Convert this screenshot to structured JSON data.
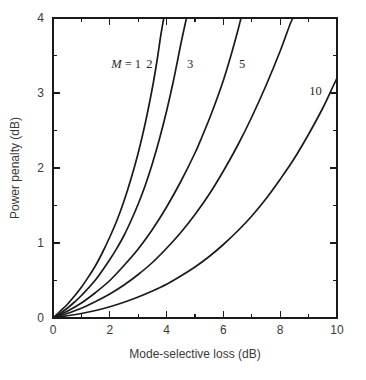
{
  "chart_data": {
    "type": "line",
    "title": "",
    "xlabel": "Mode-selective loss (dB)",
    "ylabel": "Power penalty (dB)",
    "xlim": [
      0,
      10
    ],
    "ylim": [
      0,
      4
    ],
    "grid": false,
    "legend_position": "inline-curve-labels",
    "x_ticks_major": [
      0,
      2,
      4,
      6,
      8,
      10
    ],
    "x_ticks_minor": [
      1,
      3,
      5,
      7,
      9
    ],
    "x_tick_labels": [
      "0",
      "2",
      "4",
      "6",
      "8",
      "10"
    ],
    "y_ticks_major": [
      0,
      1,
      2,
      3,
      4
    ],
    "y_ticks_minor": [
      0.5,
      1.5,
      2.5,
      3.5
    ],
    "y_tick_labels": [
      "0",
      "1",
      "2",
      "3",
      "4"
    ],
    "series": [
      {
        "name": "M = 1",
        "label": "M = 1",
        "label_x": 2.05,
        "label_y": 3.33,
        "points": [
          [
            0,
            0
          ],
          [
            0.25,
            0.09
          ],
          [
            0.5,
            0.18
          ],
          [
            0.75,
            0.29
          ],
          [
            1.0,
            0.41
          ],
          [
            1.25,
            0.55
          ],
          [
            1.5,
            0.7
          ],
          [
            1.75,
            0.88
          ],
          [
            2.0,
            1.08
          ],
          [
            2.25,
            1.3
          ],
          [
            2.5,
            1.56
          ],
          [
            2.75,
            1.86
          ],
          [
            3.0,
            2.2
          ],
          [
            3.25,
            2.6
          ],
          [
            3.5,
            3.07
          ],
          [
            3.65,
            3.4
          ],
          [
            3.8,
            3.78
          ],
          [
            3.9,
            4.0
          ]
        ]
      },
      {
        "name": "M = 2",
        "label": "2",
        "label_x": 3.28,
        "label_y": 3.33,
        "points": [
          [
            0,
            0
          ],
          [
            0.25,
            0.06
          ],
          [
            0.5,
            0.13
          ],
          [
            0.75,
            0.21
          ],
          [
            1.0,
            0.3
          ],
          [
            1.5,
            0.51
          ],
          [
            2.0,
            0.78
          ],
          [
            2.25,
            0.93
          ],
          [
            2.5,
            1.1
          ],
          [
            2.75,
            1.3
          ],
          [
            3.0,
            1.52
          ],
          [
            3.25,
            1.77
          ],
          [
            3.5,
            2.06
          ],
          [
            3.75,
            2.39
          ],
          [
            4.0,
            2.76
          ],
          [
            4.25,
            3.18
          ],
          [
            4.5,
            3.65
          ],
          [
            4.7,
            4.0
          ]
        ]
      },
      {
        "name": "M = 3",
        "label": "3",
        "label_x": 4.72,
        "label_y": 3.33,
        "points": [
          [
            0,
            0
          ],
          [
            0.5,
            0.09
          ],
          [
            1.0,
            0.2
          ],
          [
            1.5,
            0.34
          ],
          [
            2.0,
            0.5
          ],
          [
            2.5,
            0.7
          ],
          [
            3.0,
            0.92
          ],
          [
            3.5,
            1.18
          ],
          [
            4.0,
            1.48
          ],
          [
            4.5,
            1.82
          ],
          [
            5.0,
            2.2
          ],
          [
            5.25,
            2.42
          ],
          [
            5.5,
            2.65
          ],
          [
            5.75,
            2.9
          ],
          [
            6.0,
            3.17
          ],
          [
            6.25,
            3.48
          ],
          [
            6.5,
            3.82
          ],
          [
            6.62,
            4.0
          ]
        ]
      },
      {
        "name": "M = 5",
        "label": "5",
        "label_x": 6.55,
        "label_y": 3.33,
        "points": [
          [
            0,
            0
          ],
          [
            0.5,
            0.06
          ],
          [
            1.0,
            0.13
          ],
          [
            1.5,
            0.22
          ],
          [
            2.0,
            0.32
          ],
          [
            2.5,
            0.44
          ],
          [
            3.0,
            0.58
          ],
          [
            3.5,
            0.74
          ],
          [
            4.0,
            0.93
          ],
          [
            4.5,
            1.14
          ],
          [
            5.0,
            1.38
          ],
          [
            5.5,
            1.65
          ],
          [
            6.0,
            1.96
          ],
          [
            6.5,
            2.3
          ],
          [
            7.0,
            2.68
          ],
          [
            7.5,
            3.1
          ],
          [
            8.0,
            3.56
          ],
          [
            8.35,
            3.92
          ],
          [
            8.45,
            4.0
          ]
        ]
      },
      {
        "name": "M = 10",
        "label": "10",
        "label_x": 9.02,
        "label_y": 2.98,
        "points": [
          [
            0,
            0
          ],
          [
            0.5,
            0.03
          ],
          [
            1.0,
            0.06
          ],
          [
            1.5,
            0.1
          ],
          [
            2.0,
            0.15
          ],
          [
            2.5,
            0.21
          ],
          [
            3.0,
            0.28
          ],
          [
            3.5,
            0.36
          ],
          [
            4.0,
            0.45
          ],
          [
            4.5,
            0.56
          ],
          [
            5.0,
            0.68
          ],
          [
            5.5,
            0.82
          ],
          [
            6.0,
            0.98
          ],
          [
            6.5,
            1.16
          ],
          [
            7.0,
            1.36
          ],
          [
            7.5,
            1.59
          ],
          [
            8.0,
            1.85
          ],
          [
            8.5,
            2.13
          ],
          [
            9.0,
            2.45
          ],
          [
            9.5,
            2.8
          ],
          [
            9.85,
            3.08
          ],
          [
            10.0,
            3.2
          ]
        ]
      }
    ],
    "colors": {
      "curve": "#1a1a1a",
      "axis": "#1a1a1a",
      "text": "#3a3a3a",
      "background": "#ffffff"
    }
  }
}
